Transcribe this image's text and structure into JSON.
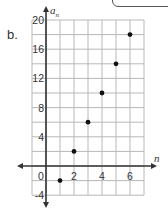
{
  "part_label": "b.",
  "chart_data": {
    "type": "scatter",
    "title": "",
    "xlabel": "n",
    "ylabel": "a_n",
    "x": [
      1,
      2,
      3,
      4,
      5,
      6
    ],
    "y": [
      -2,
      2,
      6,
      10,
      14,
      18
    ],
    "series": [
      {
        "name": "a_n",
        "x": [
          1,
          2,
          3,
          4,
          5,
          6
        ],
        "values": [
          -2,
          2,
          6,
          10,
          14,
          18
        ]
      }
    ],
    "xlim": [
      -1,
      7
    ],
    "ylim": [
      -4,
      20
    ],
    "x_ticks": [
      "0",
      "2",
      "4",
      "6"
    ],
    "y_ticks": [
      "20",
      "16",
      "12",
      "8",
      "4",
      "-4"
    ],
    "grid": true,
    "grid_step_x": 1,
    "grid_step_y": 2,
    "legend": "none"
  },
  "colors": {
    "grid": "#b8b8b8",
    "axis": "#333333",
    "point": "#111111"
  }
}
